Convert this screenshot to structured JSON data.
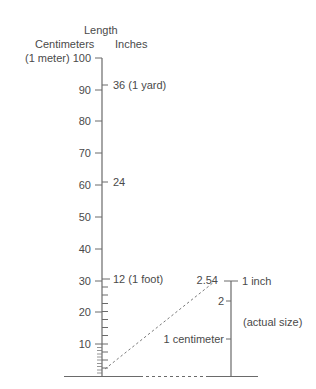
{
  "title": "Length",
  "headers": {
    "left": "Centimeters",
    "right": "Inches"
  },
  "cm_scale": {
    "top_prefix": "(1 meter) 100",
    "labels": [
      "90",
      "80",
      "70",
      "60",
      "50",
      "40",
      "30",
      "20",
      "10"
    ]
  },
  "inch_scale": {
    "labels": [
      "36 (1 yard)",
      "24",
      "12 (1 foot)"
    ]
  },
  "actual_size": {
    "top_value": "2.54",
    "top_label": "1 inch",
    "mid_value": "2",
    "cm_label": "1 centimeter",
    "note": "(actual size)"
  },
  "colors": {
    "line": "#6a6a6a",
    "text": "#4a4a4a"
  }
}
